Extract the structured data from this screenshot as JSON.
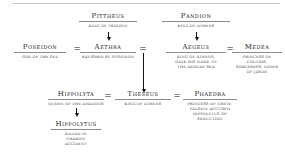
{
  "diagram": {
    "type": "family-tree",
    "generations": [
      {
        "people": [
          {
            "id": "pittheus",
            "name": "Pittheus",
            "description": "King of Troizen"
          },
          {
            "id": "pandion",
            "name": "Pandion",
            "description": "King of Athens"
          }
        ]
      },
      {
        "people": [
          {
            "id": "poseidon",
            "name": "Poseidon",
            "description": "God of the sea"
          },
          {
            "id": "aethra",
            "name": "Aethra",
            "description": "Ravished by Poseidon"
          },
          {
            "id": "aegeus",
            "name": "Aegeus",
            "description": "King of Athens, gave his name to the Aegean Sea"
          },
          {
            "id": "medea",
            "name": "Medea",
            "description": "Princess of Colchis, sorceress, lover of Jason"
          }
        ]
      },
      {
        "people": [
          {
            "id": "hippolyta",
            "name": "Hippolyta",
            "description": "Queen of the Amazons"
          },
          {
            "id": "theseus",
            "name": "Theseus",
            "description": "King of Athens"
          },
          {
            "id": "phaedra",
            "name": "Phaedra",
            "description": "Princess of Crete, falsely accused Hippolytus of seduction"
          }
        ]
      },
      {
        "people": [
          {
            "id": "hippolytus",
            "name": "Hippolytus",
            "description": "Killed in chariot accident"
          }
        ]
      }
    ],
    "marriage_symbol": "=",
    "unions": [
      [
        "poseidon",
        "aethra"
      ],
      [
        "aethra",
        "aegeus"
      ],
      [
        "aegeus",
        "medea"
      ],
      [
        "hippolyta",
        "theseus"
      ],
      [
        "theseus",
        "phaedra"
      ]
    ],
    "descents": [
      {
        "from": "pittheus",
        "to": "aethra"
      },
      {
        "from": "pandion",
        "to": "aegeus"
      },
      {
        "from": "aethra+aegeus",
        "to": "theseus"
      },
      {
        "from": "hippolyta",
        "to": "hippolytus"
      }
    ]
  }
}
